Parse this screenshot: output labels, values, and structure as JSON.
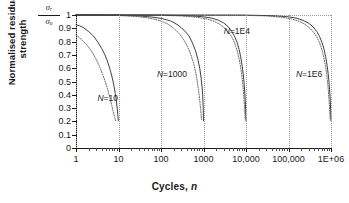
{
  "chart_data": {
    "type": "line",
    "title": "",
    "xlabel": "Cycles, n",
    "ylabel": "Normalised residual strength",
    "yaxis_symbol_numerator": "σ",
    "yaxis_symbol_numerator_sub": "r",
    "yaxis_symbol_denominator": "σ",
    "yaxis_symbol_denominator_sub": "u",
    "xscale": "log",
    "yscale": "linear",
    "xlim": [
      1,
      1000000
    ],
    "ylim": [
      0,
      1
    ],
    "grid": "dotted vertical at decades, dotted horizontal at y=1",
    "legend": "inline curve annotations",
    "xticks": [
      1,
      10,
      100,
      1000,
      10000,
      100000,
      1000000
    ],
    "xticklabels": [
      "1",
      "10",
      "100",
      "1000",
      "10,000",
      "100,000",
      "1E+06"
    ],
    "yticks": [
      0,
      0.1,
      0.2,
      0.3,
      0.4,
      0.5,
      0.6,
      0.7,
      0.8,
      0.9,
      1
    ],
    "yticklabels": [
      "0",
      "0.1",
      "0.2",
      "0.3",
      "0.4",
      "0.5",
      "0.6",
      "0.7",
      "0.8",
      "0.9",
      "1"
    ],
    "annotations": [
      {
        "text": "N=10",
        "n_value": 10,
        "x": 3.2,
        "y": 0.37
      },
      {
        "text": "N=1000",
        "n_value": 1000,
        "x": 80,
        "y": 0.55
      },
      {
        "text": "N=1E4",
        "n_value": 10000,
        "x": 3000,
        "y": 0.87
      },
      {
        "text": "N=1E6",
        "n_value": 1000000,
        "x": 150000,
        "y": 0.55
      }
    ],
    "series": [
      {
        "name": "N=10 solid",
        "style": "solid",
        "N": 10,
        "points": [
          [
            1,
            0.925
          ],
          [
            1.2,
            0.92
          ],
          [
            1.5,
            0.905
          ],
          [
            2,
            0.875
          ],
          [
            2.6,
            0.84
          ],
          [
            3.2,
            0.8
          ],
          [
            4,
            0.75
          ],
          [
            4.8,
            0.7
          ],
          [
            5.6,
            0.645
          ],
          [
            6.4,
            0.585
          ],
          [
            7.1,
            0.53
          ],
          [
            7.8,
            0.47
          ],
          [
            8.4,
            0.41
          ],
          [
            8.9,
            0.355
          ],
          [
            9.3,
            0.3
          ],
          [
            9.65,
            0.25
          ],
          [
            9.9,
            0.205
          ]
        ]
      },
      {
        "name": "N=10 dotted",
        "style": "dotted",
        "N": 10,
        "points": [
          [
            1,
            0.845
          ],
          [
            1.15,
            0.835
          ],
          [
            1.4,
            0.81
          ],
          [
            1.8,
            0.775
          ],
          [
            2.3,
            0.73
          ],
          [
            2.9,
            0.675
          ],
          [
            3.5,
            0.62
          ],
          [
            4.1,
            0.565
          ],
          [
            4.8,
            0.505
          ],
          [
            5.5,
            0.445
          ],
          [
            6.2,
            0.385
          ],
          [
            6.9,
            0.325
          ],
          [
            7.5,
            0.275
          ],
          [
            8.1,
            0.23
          ],
          [
            8.6,
            0.205
          ]
        ]
      },
      {
        "name": "N=1000 solid",
        "style": "solid",
        "N": 1000,
        "points": [
          [
            1,
            1.0
          ],
          [
            10,
            0.998
          ],
          [
            30,
            0.993
          ],
          [
            60,
            0.985
          ],
          [
            100,
            0.975
          ],
          [
            170,
            0.955
          ],
          [
            250,
            0.925
          ],
          [
            350,
            0.885
          ],
          [
            450,
            0.845
          ],
          [
            550,
            0.79
          ],
          [
            650,
            0.73
          ],
          [
            740,
            0.665
          ],
          [
            820,
            0.595
          ],
          [
            880,
            0.525
          ],
          [
            925,
            0.46
          ],
          [
            955,
            0.4
          ],
          [
            975,
            0.34
          ],
          [
            988,
            0.285
          ],
          [
            995,
            0.24
          ],
          [
            999,
            0.205
          ]
        ]
      },
      {
        "name": "N=1000 dotted",
        "style": "dotted",
        "N": 1000,
        "points": [
          [
            1,
            1.0
          ],
          [
            8,
            0.997
          ],
          [
            25,
            0.99
          ],
          [
            50,
            0.978
          ],
          [
            90,
            0.96
          ],
          [
            140,
            0.935
          ],
          [
            200,
            0.9
          ],
          [
            270,
            0.86
          ],
          [
            340,
            0.815
          ],
          [
            420,
            0.765
          ],
          [
            500,
            0.705
          ],
          [
            580,
            0.64
          ],
          [
            650,
            0.575
          ],
          [
            710,
            0.505
          ],
          [
            765,
            0.435
          ],
          [
            810,
            0.37
          ],
          [
            845,
            0.31
          ],
          [
            875,
            0.26
          ],
          [
            895,
            0.215
          ]
        ]
      },
      {
        "name": "N=1E4 solid",
        "style": "solid",
        "N": 10000,
        "points": [
          [
            1,
            1.0
          ],
          [
            100,
            0.999
          ],
          [
            400,
            0.995
          ],
          [
            900,
            0.988
          ],
          [
            1500,
            0.978
          ],
          [
            2200,
            0.962
          ],
          [
            3000,
            0.94
          ],
          [
            3800,
            0.912
          ],
          [
            4600,
            0.878
          ],
          [
            5400,
            0.838
          ],
          [
            6200,
            0.792
          ],
          [
            6900,
            0.74
          ],
          [
            7500,
            0.685
          ],
          [
            8100,
            0.62
          ],
          [
            8600,
            0.555
          ],
          [
            9000,
            0.49
          ],
          [
            9350,
            0.42
          ],
          [
            9600,
            0.355
          ],
          [
            9800,
            0.29
          ],
          [
            9920,
            0.24
          ],
          [
            9990,
            0.205
          ]
        ]
      },
      {
        "name": "N=1E4 dotted",
        "style": "dotted",
        "N": 10000,
        "points": [
          [
            1,
            1.0
          ],
          [
            80,
            0.998
          ],
          [
            300,
            0.993
          ],
          [
            700,
            0.983
          ],
          [
            1200,
            0.97
          ],
          [
            1800,
            0.952
          ],
          [
            2500,
            0.928
          ],
          [
            3200,
            0.9
          ],
          [
            4000,
            0.866
          ],
          [
            4800,
            0.826
          ],
          [
            5500,
            0.782
          ],
          [
            6200,
            0.732
          ],
          [
            6800,
            0.678
          ],
          [
            7400,
            0.618
          ],
          [
            7900,
            0.555
          ],
          [
            8350,
            0.49
          ],
          [
            8700,
            0.425
          ],
          [
            9000,
            0.36
          ],
          [
            9250,
            0.3
          ],
          [
            9450,
            0.25
          ],
          [
            9600,
            0.21
          ]
        ]
      },
      {
        "name": "N=1E6 solid",
        "style": "solid",
        "N": 1000000,
        "points": [
          [
            1,
            1.0
          ],
          [
            10000,
            0.999
          ],
          [
            40000,
            0.995
          ],
          [
            90000,
            0.988
          ],
          [
            150000,
            0.977
          ],
          [
            220000,
            0.96
          ],
          [
            300000,
            0.938
          ],
          [
            380000,
            0.91
          ],
          [
            460000,
            0.877
          ],
          [
            540000,
            0.837
          ],
          [
            620000,
            0.79
          ],
          [
            690000,
            0.74
          ],
          [
            750000,
            0.685
          ],
          [
            810000,
            0.62
          ],
          [
            860000,
            0.555
          ],
          [
            900000,
            0.49
          ],
          [
            935000,
            0.42
          ],
          [
            960000,
            0.355
          ],
          [
            980000,
            0.29
          ],
          [
            992000,
            0.24
          ],
          [
            999000,
            0.205
          ]
        ]
      },
      {
        "name": "N=1E6 dotted",
        "style": "dotted",
        "N": 1000000,
        "points": [
          [
            1,
            1.0
          ],
          [
            8000,
            0.998
          ],
          [
            30000,
            0.993
          ],
          [
            70000,
            0.983
          ],
          [
            120000,
            0.97
          ],
          [
            180000,
            0.952
          ],
          [
            250000,
            0.928
          ],
          [
            320000,
            0.9
          ],
          [
            400000,
            0.866
          ],
          [
            480000,
            0.826
          ],
          [
            550000,
            0.782
          ],
          [
            620000,
            0.732
          ],
          [
            680000,
            0.678
          ],
          [
            740000,
            0.618
          ],
          [
            790000,
            0.555
          ],
          [
            835000,
            0.49
          ],
          [
            870000,
            0.425
          ],
          [
            900000,
            0.36
          ],
          [
            925000,
            0.3
          ],
          [
            945000,
            0.25
          ],
          [
            960000,
            0.21
          ]
        ]
      }
    ]
  }
}
